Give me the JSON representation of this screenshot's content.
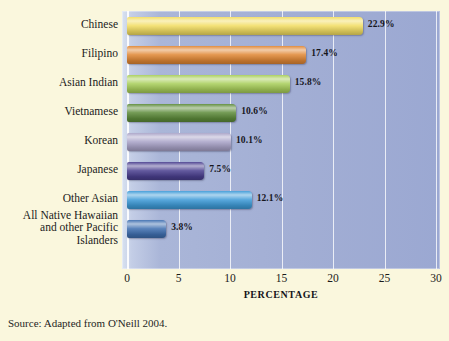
{
  "figure": {
    "background_color": "#faf7dd",
    "plot_background_color": "#9ba8d2",
    "source_note": "Source: Adapted from O'Neill 2004."
  },
  "chart_data": {
    "type": "bar",
    "orientation": "horizontal",
    "title": "",
    "xlabel": "PERCENTAGE",
    "ylabel": "",
    "xlim": [
      0,
      30
    ],
    "xticks": [
      "0",
      "5",
      "10",
      "15",
      "20",
      "25",
      "30"
    ],
    "grid": true,
    "legend": "none",
    "categories": [
      "Chinese",
      "Filipino",
      "Asian Indian",
      "Vietnamese",
      "Korean",
      "Japanese",
      "Other Asian",
      "All Native Hawaiian\nand other Pacific\nIslanders"
    ],
    "values": [
      22.9,
      17.4,
      15.8,
      10.6,
      10.1,
      7.5,
      12.1,
      3.8
    ],
    "data_labels": [
      "22.9%",
      "17.4%",
      "15.8%",
      "10.6%",
      "10.1%",
      "7.5%",
      "12.1%",
      "3.8%"
    ],
    "bar_colors": [
      "#f2dd62",
      "#e08735",
      "#a8ce5a",
      "#5d8b3a",
      "#a9a3c8",
      "#4a3f8f",
      "#3e9bd8",
      "#3f6fb0"
    ]
  }
}
